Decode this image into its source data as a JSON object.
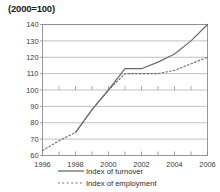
{
  "chart_data": {
    "type": "line",
    "title": "(2000=100)",
    "xlabel": "",
    "ylabel": "",
    "xlim": [
      1996,
      2006
    ],
    "ylim": [
      60,
      140
    ],
    "ytick_values": [
      60,
      70,
      80,
      90,
      100,
      110,
      120,
      130,
      140
    ],
    "ytick_labels": [
      "60",
      "70",
      "80",
      "90",
      "100",
      "110",
      "120",
      "130",
      "140"
    ],
    "xtick_values": [
      1996,
      1998,
      2000,
      2002,
      2004,
      2006
    ],
    "xtick_labels": [
      "1996",
      "1998",
      "2000",
      "2002",
      "2004",
      "2006"
    ],
    "grid": "horizontal",
    "legend_position": "bottom",
    "x": [
      1996,
      1997,
      1998,
      1999,
      2000,
      2001,
      2002,
      2003,
      2004,
      2005,
      2006
    ],
    "series": [
      {
        "name": "Index of turnover",
        "style": "solid",
        "color": "#6b6b6b",
        "x": [
          1998,
          1999,
          2000,
          2001,
          2002,
          2003,
          2004,
          2005,
          2006
        ],
        "values": [
          74,
          88,
          100,
          113,
          113,
          117,
          122,
          130,
          140
        ]
      },
      {
        "name": "Index of employment",
        "style": "dashed",
        "color": "#6b6b6b",
        "x": [
          1996,
          1997,
          1998,
          1999,
          2000,
          2001,
          2002,
          2003,
          2004,
          2005,
          2006
        ],
        "values": [
          63,
          69,
          74,
          88,
          100,
          110,
          110,
          110,
          112,
          116,
          120
        ]
      }
    ]
  },
  "legend": {
    "items": [
      {
        "label": "Index of turnover",
        "style": "solid"
      },
      {
        "label": "Index of employment",
        "style": "dashed"
      }
    ]
  },
  "colors": {
    "line": "#6b6b6b",
    "grid": "#b0b0b0",
    "axis": "#8a8a8a",
    "text": "#2b2b2b"
  }
}
